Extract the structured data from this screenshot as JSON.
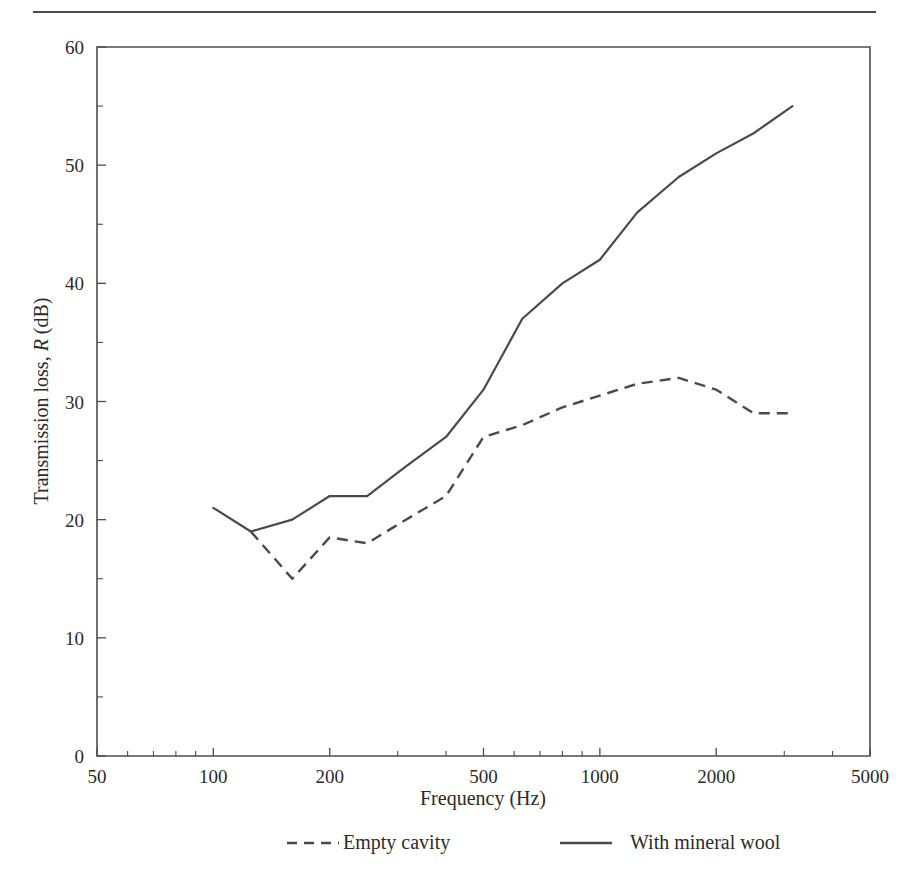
{
  "page": {
    "background_color": "#ffffff",
    "ink_color": "#4a4a4a",
    "top_rule": "horizontal-rule"
  },
  "chart_data": {
    "type": "line",
    "title": "",
    "xlabel": "Frequency (Hz)",
    "ylabel_prefix": "Transmission loss, ",
    "ylabel_symbol": "R",
    "ylabel_suffix": " (dB)",
    "xscale": "log",
    "yscale": "linear",
    "xlim": [
      50,
      5000
    ],
    "ylim": [
      0,
      60
    ],
    "grid": false,
    "legend_position": "below-axes",
    "xticks": [
      50,
      100,
      200,
      500,
      1000,
      2000,
      5000
    ],
    "xticklabels": [
      "50",
      "100",
      "200",
      "500",
      "1000",
      "2000",
      "5000"
    ],
    "yticks": [
      0,
      10,
      20,
      30,
      40,
      50,
      60
    ],
    "yticklabels": [
      "0",
      "10",
      "20",
      "30",
      "40",
      "50",
      "60"
    ],
    "yminorticks": [
      5,
      15,
      25,
      35,
      45,
      55
    ],
    "series": [
      {
        "name": "Empty cavity",
        "style": "dashed",
        "x": [
          125,
          160,
          200,
          250,
          315,
          400,
          500,
          630,
          800,
          1000,
          1250,
          1600,
          2000,
          2500,
          3150
        ],
        "values": [
          19,
          15,
          18.5,
          18,
          20,
          22,
          27,
          28,
          29.5,
          30.5,
          31.5,
          32,
          31,
          29,
          29
        ]
      },
      {
        "name": "With mineral wool",
        "style": "solid",
        "x": [
          100,
          125,
          160,
          200,
          250,
          315,
          400,
          500,
          630,
          800,
          1000,
          1250,
          1600,
          2000,
          2500,
          3150
        ],
        "values": [
          21,
          19,
          20,
          22,
          22,
          24.5,
          27,
          31,
          37,
          40,
          42,
          46,
          49,
          51,
          52.7,
          55
        ]
      }
    ]
  },
  "legend": {
    "items": [
      {
        "label": "Empty cavity",
        "style": "dashed"
      },
      {
        "label": "With mineral wool",
        "style": "solid"
      }
    ]
  }
}
